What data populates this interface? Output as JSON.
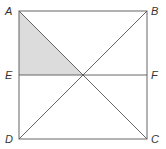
{
  "diagram": {
    "type": "geometry-square",
    "points": {
      "A": {
        "label": "A",
        "x": 19,
        "y": 11
      },
      "B": {
        "label": "B",
        "x": 147,
        "y": 11
      },
      "C": {
        "label": "C",
        "x": 147,
        "y": 139
      },
      "D": {
        "label": "D",
        "x": 19,
        "y": 139
      },
      "E": {
        "label": "E",
        "x": 19,
        "y": 75
      },
      "F": {
        "label": "F",
        "x": 147,
        "y": 75
      },
      "O": {
        "label": "",
        "x": 83,
        "y": 75
      }
    },
    "segments": [
      "AB",
      "BC",
      "CD",
      "DA",
      "AC",
      "BD",
      "EF"
    ],
    "shaded_region": [
      "A",
      "E",
      "O"
    ],
    "colors": {
      "line": "#555555",
      "shade": "#dcdcdc",
      "label": "#333333"
    }
  }
}
